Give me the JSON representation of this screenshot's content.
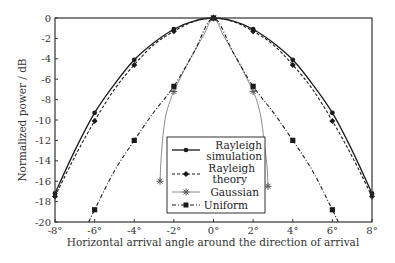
{
  "chart_data": {
    "type": "line",
    "title": "",
    "xlabel": "Horizontal arrival angle around the direction of arrival",
    "ylabel": "Normalized power / dB",
    "xlim": [
      -8,
      8
    ],
    "ylim": [
      -20,
      0
    ],
    "x_ticks": [
      -8,
      -6,
      -4,
      -2,
      0,
      2,
      4,
      6,
      8
    ],
    "x_tick_labels": [
      "-8°",
      "-6°",
      "-4°",
      "-2°",
      "0°",
      "2°",
      "4°",
      "6°",
      "8°"
    ],
    "y_ticks": [
      0,
      -2,
      -4,
      -6,
      -8,
      -10,
      -12,
      -14,
      -16,
      -18,
      -20
    ],
    "y_tick_labels": [
      "0",
      "-2",
      "-4",
      "-6",
      "-8",
      "-10",
      "-12",
      "-14",
      "-16",
      "-18",
      "-20"
    ],
    "grid": false,
    "legend_position": "lower center (inside plot)",
    "series": [
      {
        "name": "Rayleigh simulation",
        "style": "solid",
        "marker": "circle",
        "x": [
          -8,
          -7,
          -6,
          -5,
          -4,
          -3,
          -2,
          -1,
          0,
          1,
          2,
          3,
          4,
          5,
          6,
          7,
          8
        ],
        "values": [
          -17.2,
          -13.0,
          -9.3,
          -6.5,
          -4.1,
          -2.4,
          -1.1,
          -0.3,
          0,
          -0.3,
          -1.1,
          -2.4,
          -4.1,
          -6.5,
          -9.3,
          -13.0,
          -17.2
        ],
        "marker_x": [
          -8,
          -6,
          -4,
          -2,
          0,
          2,
          4,
          6,
          8
        ]
      },
      {
        "name": "Rayleigh theory",
        "style": "dashed",
        "marker": "diamond",
        "x": [
          -8,
          -7,
          -6,
          -5,
          -4,
          -3,
          -2,
          -1,
          0,
          1,
          2,
          3,
          4,
          5,
          6,
          7,
          8
        ],
        "values": [
          -17.5,
          -13.6,
          -10.1,
          -7.0,
          -4.6,
          -2.6,
          -1.3,
          -0.35,
          0,
          -0.35,
          -1.3,
          -2.6,
          -4.6,
          -7.0,
          -10.1,
          -13.6,
          -17.5
        ],
        "marker_x": [
          -8,
          -6,
          -4,
          -2,
          0,
          2,
          4,
          6,
          8
        ]
      },
      {
        "name": "Gaussian",
        "style": "solid-thin-gray",
        "marker": "star",
        "x": [
          -2.7,
          -2.65,
          -2.55,
          -2.4,
          -2.2,
          -2.0,
          -1.5,
          -1.0,
          -0.5,
          0,
          0.5,
          1.0,
          1.5,
          2.0,
          2.2,
          2.4,
          2.55,
          2.7,
          2.75
        ],
        "values": [
          -16.0,
          -14.0,
          -11.5,
          -9.5,
          -8.2,
          -7.2,
          -5.2,
          -3.4,
          -1.7,
          0,
          -1.7,
          -3.4,
          -5.2,
          -7.2,
          -8.2,
          -9.8,
          -12.0,
          -14.5,
          -16.5
        ],
        "marker_points": [
          [
            -2.7,
            -16.0
          ],
          [
            -2.0,
            -7.2
          ],
          [
            0,
            0
          ],
          [
            2.0,
            -7.2
          ],
          [
            2.75,
            -16.5
          ]
        ]
      },
      {
        "name": "Uniform",
        "style": "dash-dot",
        "marker": "square",
        "x": [
          -6.3,
          -6,
          -5,
          -4,
          -3,
          -2,
          -1,
          0,
          1,
          2,
          3,
          4,
          5,
          6,
          6.3
        ],
        "values": [
          -20,
          -18.8,
          -15.0,
          -12.0,
          -9.2,
          -6.7,
          -3.4,
          0,
          -3.4,
          -6.7,
          -9.2,
          -12.0,
          -15.0,
          -18.8,
          -20
        ],
        "marker_points": [
          [
            -6,
            -18.8
          ],
          [
            -4,
            -12.0
          ],
          [
            -2,
            -6.7
          ],
          [
            0,
            0
          ],
          [
            2,
            -6.7
          ],
          [
            4,
            -12.0
          ],
          [
            6,
            -18.8
          ]
        ]
      }
    ]
  },
  "legend": {
    "items": [
      {
        "line1": "Rayleigh",
        "line2": "simulation"
      },
      {
        "line1": "Rayleigh",
        "line2": "theory"
      },
      {
        "line1": "Gaussian",
        "line2": ""
      },
      {
        "line1": "Uniform",
        "line2": ""
      }
    ]
  },
  "colors": {
    "axis": "#333333",
    "rayleigh_sim": "#1a1a1a",
    "rayleigh_theory": "#1a1a1a",
    "gaussian": "#8a8a8a",
    "uniform": "#1a1a1a"
  }
}
